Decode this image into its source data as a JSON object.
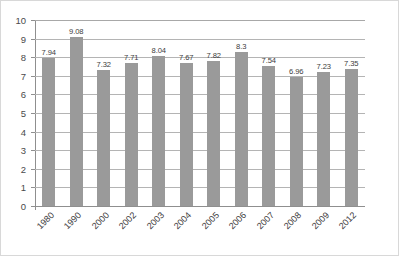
{
  "chart_data": {
    "type": "bar",
    "title": "",
    "subtitle": "",
    "xlabel": "",
    "ylabel": "",
    "categories": [
      "1980",
      "1990",
      "2000",
      "2002",
      "2003",
      "2004",
      "2005",
      "2006",
      "2007",
      "2008",
      "2009",
      "2012"
    ],
    "values": [
      7.94,
      9.08,
      7.32,
      7.71,
      8.04,
      7.67,
      7.82,
      8.3,
      7.54,
      6.96,
      7.23,
      7.35
    ],
    "value_labels": [
      "7.94",
      "9.08",
      "7.32",
      "7.71",
      "8.04",
      "7.67",
      "7.82",
      "8.3",
      "7.54",
      "6.96",
      "7.23",
      "7.35"
    ],
    "ylim": [
      0,
      10
    ],
    "ytick_step": 1,
    "yticks": [
      10,
      9,
      8,
      7,
      6,
      5,
      4,
      3,
      2,
      1,
      0
    ],
    "ytick_labels": [
      "10",
      "9",
      "8",
      "7",
      "6",
      "5",
      "4",
      "3",
      "2",
      "1",
      "0"
    ],
    "grid": "horizontal",
    "legend": "none",
    "bar_color": "#9a9a9a",
    "grid_color": "#b4b4b4",
    "axis_color": "#8f8f8f",
    "label_color": "#3c3c3c",
    "background": "#ffffff",
    "border_color": "#d8d8d8",
    "xtick_rotation": -45
  }
}
